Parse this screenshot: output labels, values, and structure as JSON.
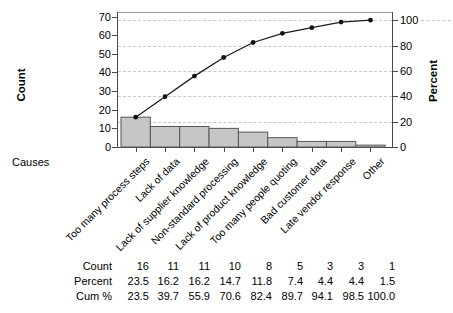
{
  "chart_data": {
    "type": "bar",
    "subtype": "pareto-combo (bars + cumulative percent line)",
    "title": "",
    "categories": [
      "Too many process steps",
      "Lack of data",
      "Lack of supplier knowledge",
      "Non-standard processing",
      "Lack of product knowledge",
      "Too many people quoting",
      "Bad customer data",
      "Late vendor response",
      "Other"
    ],
    "series": [
      {
        "name": "Count",
        "type": "bar",
        "axis": "left",
        "values": [
          16,
          11,
          11,
          10,
          8,
          5,
          3,
          3,
          1
        ]
      },
      {
        "name": "Cum %",
        "type": "line",
        "axis": "right",
        "values": [
          23.5,
          39.7,
          55.9,
          70.6,
          82.4,
          89.7,
          94.1,
          98.5,
          100.0
        ]
      }
    ],
    "total_count": 68,
    "xlabel": "Causes",
    "ylabel_left": "Count",
    "ylabel_right": "Percent",
    "ylim_left": [
      0,
      70
    ],
    "ylim_right": [
      0,
      100
    ],
    "left_ticks": [
      0,
      10,
      20,
      30,
      40,
      50,
      60,
      70
    ],
    "right_ticks": [
      0,
      20,
      40,
      60,
      80,
      100
    ],
    "grid": "horizontal dashed lines at right-axis (percent) tick levels",
    "legend": "none"
  },
  "table": {
    "rows": [
      {
        "label": "Count",
        "values": [
          "16",
          "11",
          "11",
          "10",
          "8",
          "5",
          "3",
          "3",
          "1"
        ]
      },
      {
        "label": "Percent",
        "values": [
          "23.5",
          "16.2",
          "16.2",
          "14.7",
          "11.8",
          "7.4",
          "4.4",
          "4.4",
          "1.5"
        ]
      },
      {
        "label": "Cum %",
        "values": [
          "23.5",
          "39.7",
          "55.9",
          "70.6",
          "82.4",
          "89.7",
          "94.1",
          "98.5",
          "100.0"
        ]
      }
    ]
  },
  "colors": {
    "bar_fill": "#c6c6c6",
    "bar_border": "#565656",
    "cum_line": "#1c1c1c",
    "marker": "#111111",
    "grid": "#c8c8c8",
    "axis": "#4a4a4a",
    "frame_top": "#9b9b9b",
    "text": "#000000",
    "background": "#ffffff"
  }
}
